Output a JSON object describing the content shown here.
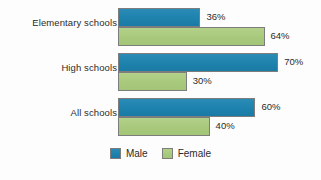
{
  "chart_data": {
    "type": "bar",
    "orientation": "horizontal",
    "title": "",
    "subtitle": "",
    "xlabel": "",
    "ylabel": "",
    "xlim": [
      0,
      100
    ],
    "grid": false,
    "legend_position": "bottom-center",
    "value_suffix": "%",
    "categories": [
      "Elementary schools",
      "High schools",
      "All schools"
    ],
    "series": [
      {
        "name": "Male",
        "color": "#1d82ad",
        "values": [
          36,
          70,
          60
        ]
      },
      {
        "name": "Female",
        "color": "#a8c97c",
        "values": [
          64,
          30,
          40
        ]
      }
    ],
    "data_labels": [
      {
        "category": "Elementary schools",
        "series": "Male",
        "value": 36,
        "text": "36%"
      },
      {
        "category": "Elementary schools",
        "series": "Female",
        "value": 64,
        "text": "64%"
      },
      {
        "category": "High schools",
        "series": "Male",
        "value": 70,
        "text": "70%"
      },
      {
        "category": "High schools",
        "series": "Female",
        "value": 30,
        "text": "30%"
      },
      {
        "category": "All schools",
        "series": "Male",
        "value": 60,
        "text": "60%"
      },
      {
        "category": "All schools",
        "series": "Female",
        "value": 40,
        "text": "40%"
      }
    ]
  },
  "legend": {
    "items": [
      {
        "label": "Male",
        "swatch": "male-swatch",
        "color": "#1d82ad"
      },
      {
        "label": "Female",
        "swatch": "female-swatch",
        "color": "#a8c97c"
      }
    ]
  },
  "colors": {
    "background": "#fdfdfd",
    "male": "#1d82ad",
    "female": "#a8c97c",
    "bar_border": "#7d7d7d",
    "text": "#2b2b2b"
  }
}
